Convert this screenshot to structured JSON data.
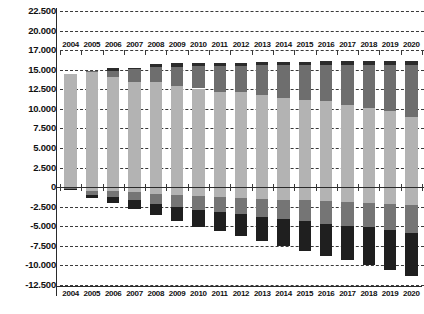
{
  "chart_data": {
    "type": "bar",
    "subtype": "stacked-bar-positive-negative",
    "title": "",
    "subtitle": "",
    "xlabel": "",
    "ylabel": "",
    "grid": true,
    "legend": null,
    "legend_position": "none",
    "ylim": [
      -12500,
      22500
    ],
    "ytick_labels": [
      "22.500",
      "20.000",
      "17.000",
      "15.000",
      "12.500",
      "10.000",
      "7.500",
      "5.000",
      "2.500",
      "0",
      "-2.500",
      "-5.000",
      "-7.500",
      "-10.000",
      "-12.500"
    ],
    "ytick_values": [
      22500,
      20000,
      17500,
      15000,
      12500,
      10000,
      7500,
      5000,
      2500,
      0,
      -2500,
      -5000,
      -7500,
      -10000,
      -12500
    ],
    "categories": [
      "2004",
      "2005",
      "2006",
      "2007",
      "2008",
      "2009",
      "2010",
      "2011",
      "2012",
      "2013",
      "2014",
      "2015",
      "2016",
      "2017",
      "2018",
      "2019",
      "2020"
    ],
    "category_axis_top_labels": [
      "2004",
      "2005",
      "2006",
      "2007",
      "2008",
      "2009",
      "2010",
      "2011",
      "2012",
      "2013",
      "2014",
      "2015",
      "2016",
      "2017",
      "2018",
      "2019",
      "2020"
    ],
    "category_axis_bottom_labels": [
      "2004",
      "2005",
      "2006",
      "2007",
      "2008",
      "2009",
      "2010",
      "2011",
      "2012",
      "2013",
      "2014",
      "2015",
      "2016",
      "2017",
      "2018",
      "2019",
      "2020"
    ],
    "series": [
      {
        "name": "positive-light",
        "color": "#b3b3b3",
        "sign": "positive",
        "values": [
          14400,
          14650,
          14050,
          13450,
          13400,
          12900,
          12600,
          12100,
          12150,
          11750,
          11450,
          11150,
          10950,
          10450,
          10100,
          9700,
          8900
        ]
      },
      {
        "name": "positive-medium",
        "color": "#6e6e6e",
        "sign": "positive",
        "values": [
          0,
          200,
          800,
          1600,
          1950,
          2500,
          2850,
          3350,
          3350,
          3800,
          4100,
          4400,
          4650,
          5150,
          5500,
          5900,
          6650
        ]
      },
      {
        "name": "positive-dark",
        "color": "#2b2b2b",
        "sign": "positive",
        "values": [
          0,
          0,
          350,
          200,
          350,
          400,
          400,
          400,
          400,
          400,
          450,
          450,
          450,
          500,
          500,
          500,
          550
        ]
      },
      {
        "name": "negative-light",
        "color": "#b3b3b3",
        "sign": "negative",
        "values": [
          -150,
          -450,
          -500,
          -650,
          -900,
          -1000,
          -1150,
          -1250,
          -1350,
          -1500,
          -1600,
          -1700,
          -1800,
          -1900,
          -2000,
          -2100,
          -2250
        ]
      },
      {
        "name": "negative-medium",
        "color": "#757575",
        "sign": "negative",
        "values": [
          -100,
          -500,
          -700,
          -1050,
          -1250,
          -1500,
          -1750,
          -1900,
          -2100,
          -2300,
          -2450,
          -2650,
          -2850,
          -3000,
          -3150,
          -3400,
          -3600
        ]
      },
      {
        "name": "negative-dark",
        "color": "#1f1f1f",
        "sign": "negative",
        "values": [
          -100,
          -450,
          -800,
          -1050,
          -1400,
          -1800,
          -2200,
          -2450,
          -2800,
          -3100,
          -3450,
          -3800,
          -4100,
          -4450,
          -4800,
          -5100,
          -5550
        ]
      }
    ],
    "totals_positive": [
      14400,
      14850,
      15200,
      15250,
      15700,
      15800,
      15850,
      15850,
      15900,
      15950,
      16000,
      16000,
      16050,
      16100,
      16100,
      16100,
      16100
    ],
    "totals_negative": [
      -350,
      -1400,
      -2000,
      -2750,
      -3550,
      -4300,
      -5100,
      -5600,
      -6250,
      -6900,
      -7500,
      -8150,
      -8750,
      -9350,
      -9950,
      -10600,
      -11400
    ]
  },
  "style": {
    "background": "#ffffff",
    "grid_color": "#3a3a3a",
    "axis_color": "#2b2b2b",
    "text_color": "#111111"
  }
}
